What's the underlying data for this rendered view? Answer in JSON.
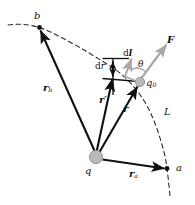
{
  "figure": {
    "name": "electrostatic-work-path-diagram",
    "width": 195,
    "height": 205,
    "background": "#ffffff",
    "colors": {
      "ink": "#111111",
      "accent_gray": "#a8a8a8",
      "charge_fill": "#b9b9b9",
      "charge_stroke": "#8a8a8a",
      "dashed": "#2b2b2b"
    }
  },
  "labels": {
    "point_b": "b",
    "point_a": "a",
    "source_charge": "q",
    "test_charge": "q",
    "test_charge_sub": "0",
    "vector_rb": "r",
    "vector_rb_sub": "b",
    "vector_ra": "r",
    "vector_ra_sub": "a",
    "vector_r": "r",
    "vector_r_prime": "r",
    "vector_r_prime_mark": "′",
    "element_dl": "d",
    "element_dl_vec": "l",
    "element_dr": "d",
    "element_dr_sym": "r",
    "force": "F",
    "angle_theta": "θ",
    "path_L": "L"
  },
  "elements": {
    "path_curve": "dashed-path-L",
    "source_point": "charge-q-dot",
    "test_point": "charge-q0-dot",
    "arrow_rb": "vector-arrow-rb",
    "arrow_ra": "vector-arrow-ra",
    "arrow_r": "vector-arrow-r",
    "arrow_r_prime": "vector-arrow-r-prime",
    "arrow_dl": "vector-arrow-dl",
    "arrow_F": "vector-arrow-F",
    "arrow_dr": "double-arrow-dr",
    "angle_arc": "angle-arc-theta"
  }
}
